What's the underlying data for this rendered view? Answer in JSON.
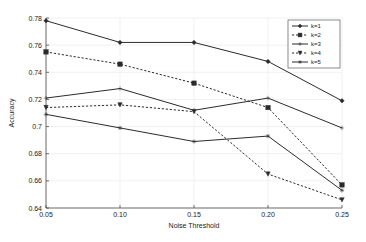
{
  "chart_data": {
    "type": "line",
    "title": "",
    "xlabel": "Noise Threshold",
    "ylabel": "Accuracy",
    "x": [
      0.05,
      0.1,
      0.15,
      0.2,
      0.25
    ],
    "xtick_labels": [
      "0.05",
      "0.10",
      "0.15",
      "0.20",
      "0.25"
    ],
    "ytick_labels": [
      "0.64",
      "0.66",
      "0.68",
      "0.7",
      "0.72",
      "0.74",
      "0.76",
      "0.78"
    ],
    "ytick_values": [
      0.64,
      0.66,
      0.68,
      0.7,
      0.72,
      0.74,
      0.76,
      0.78
    ],
    "xlim": [
      0.05,
      0.25
    ],
    "ylim": [
      0.64,
      0.78
    ],
    "grid": true,
    "legend_position": "top-right",
    "series": [
      {
        "name": "k=1",
        "style": "solid",
        "marker": "diamond",
        "values": [
          0.778,
          0.762,
          0.762,
          0.748,
          0.719
        ]
      },
      {
        "name": "k=2",
        "style": "dashed",
        "marker": "square",
        "values": [
          0.755,
          0.746,
          0.732,
          0.714,
          0.657
        ]
      },
      {
        "name": "k=3",
        "style": "solid",
        "marker": "plus",
        "values": [
          0.721,
          0.728,
          0.712,
          0.721,
          0.699
        ]
      },
      {
        "name": "k=4",
        "style": "dashed",
        "marker": "triangle-down",
        "values": [
          0.714,
          0.716,
          0.711,
          0.665,
          0.646
        ]
      },
      {
        "name": "k=5",
        "style": "solid",
        "marker": "star",
        "values": [
          0.709,
          0.699,
          0.689,
          0.693,
          0.653
        ]
      }
    ]
  },
  "colors": {
    "line": "#2b2b2b",
    "grid": "#e8e8e8",
    "axis": "#4d4d4d",
    "text": "#1a1a1a",
    "background": "#ffffff"
  }
}
